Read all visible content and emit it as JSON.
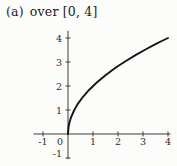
{
  "figure": {
    "caption": {
      "part_label": "(a)",
      "text": "over [0, 4]"
    }
  },
  "chart_data": {
    "type": "line",
    "title": "",
    "caption": "(a) over [0, 4]",
    "function": "y = 2*sqrt(x)",
    "interval": [
      0,
      4
    ],
    "x": [
      0,
      0.02,
      0.06,
      0.12,
      0.25,
      0.4,
      0.6,
      0.85,
      1.15,
      1.5,
      1.9,
      2.3,
      2.7,
      3.1,
      3.5,
      3.75,
      4
    ],
    "y": [
      0,
      0.283,
      0.49,
      0.693,
      1.0,
      1.265,
      1.549,
      1.844,
      2.145,
      2.449,
      2.757,
      3.033,
      3.286,
      3.521,
      3.742,
      3.873,
      4.0
    ],
    "endpoints": [
      [
        0,
        0
      ],
      [
        4,
        4
      ]
    ],
    "xlim": [
      -1.38,
      4.1
    ],
    "ylim": [
      -1.05,
      4.3
    ],
    "x_ticks": [
      -1,
      0,
      1,
      2,
      3,
      4
    ],
    "x_tick_labels": [
      "-1",
      "0",
      "1",
      "2",
      "3",
      "4"
    ],
    "y_ticks": [
      -1,
      1,
      2,
      3,
      4
    ],
    "y_tick_labels": [
      "-1",
      "1",
      "2",
      "3",
      "4"
    ],
    "grid": false,
    "legend": false,
    "axis_color": "#3d3d3d",
    "curve_color": "#151515",
    "label_color": "#2b2b2b",
    "background_color": "#fcfcfb"
  }
}
